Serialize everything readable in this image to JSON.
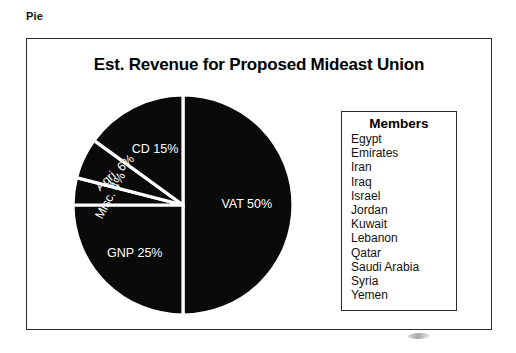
{
  "section_label": "Pie",
  "chart_data": {
    "type": "pie",
    "title": "Est. Revenue for Proposed Mideast Union",
    "categories": [
      "VAT",
      "GNP",
      "Misc.",
      "Agri.",
      "CD"
    ],
    "values": [
      50,
      25,
      4,
      6,
      15
    ],
    "unit": "%",
    "slice_labels": [
      "VAT 50%",
      "GNP 25%",
      "Misc. 4%",
      "Agri. 6%",
      "CD 15%"
    ],
    "slice_color": "#0a0a0a",
    "separator_color": "#ffffff",
    "label_color": "#ffffff",
    "start_angle_deg": 0,
    "direction": "clockwise",
    "legend": {
      "position": "right",
      "title": "Members",
      "entries": [
        "Egypt",
        "Emirates",
        "Iran",
        "Iraq",
        "Israel",
        "Jordan",
        "Kuwait",
        "Lebanon",
        "Qatar",
        "Saudi Arabia",
        "Syria",
        "Yemen"
      ]
    }
  },
  "colors": {
    "background": "#ffffff",
    "border": "#2b2b2b",
    "text": "#000000",
    "pie_fill": "#0a0a0a"
  }
}
